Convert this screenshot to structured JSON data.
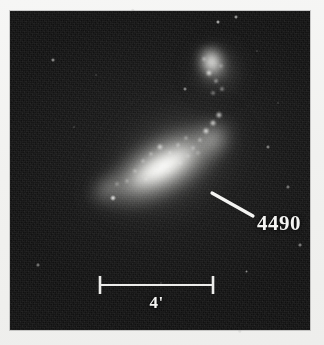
{
  "figure": {
    "kind": "astronomical-photograph",
    "media": "scanned printed plate",
    "paper_color": "#f2f2f0",
    "plate_background_color": "#101010",
    "annotation_color": "#f4f4f2"
  },
  "annotations": {
    "object_label": "4490",
    "object_label_leader_line": {
      "x1": 202,
      "y1": 182,
      "x2": 243,
      "y2": 205
    },
    "scale_bar": {
      "label": "4'",
      "unit": "arcminutes",
      "value": 4,
      "left_tick_x": 90,
      "right_tick_x": 203,
      "bar_y": 274,
      "tick_half_height": 9
    }
  },
  "objects": [
    {
      "name": "NGC 4490",
      "designation_shown": "4490",
      "type": "barred irregular / interacting spiral galaxy",
      "position_on_plate": {
        "x": 155,
        "y": 160
      },
      "major_axis_px": 215,
      "minor_axis_px": 90,
      "position_angle_deg": -30,
      "labelled": true
    },
    {
      "name": "NGC 4485",
      "designation_shown": "",
      "type": "irregular companion galaxy",
      "position_on_plate": {
        "x": 205,
        "y": 58
      },
      "major_axis_px": 46,
      "minor_axis_px": 38,
      "position_angle_deg": -14,
      "labelled": false
    }
  ],
  "knots": [
    {
      "x": 196,
      "y": 120,
      "r": 3.4,
      "o": 0.95
    },
    {
      "x": 203,
      "y": 112,
      "r": 2.8,
      "o": 0.9
    },
    {
      "x": 190,
      "y": 129,
      "r": 2.4,
      "o": 0.82
    },
    {
      "x": 209,
      "y": 104,
      "r": 2.6,
      "o": 0.88
    },
    {
      "x": 183,
      "y": 137,
      "r": 2.2,
      "o": 0.74
    },
    {
      "x": 176,
      "y": 127,
      "r": 2.0,
      "o": 0.7
    },
    {
      "x": 168,
      "y": 134,
      "r": 2.4,
      "o": 0.78
    },
    {
      "x": 160,
      "y": 142,
      "r": 2.1,
      "o": 0.7
    },
    {
      "x": 150,
      "y": 136,
      "r": 2.6,
      "o": 0.84
    },
    {
      "x": 141,
      "y": 143,
      "r": 2.2,
      "o": 0.76
    },
    {
      "x": 133,
      "y": 150,
      "r": 2.0,
      "o": 0.68
    },
    {
      "x": 147,
      "y": 155,
      "r": 2.3,
      "o": 0.74
    },
    {
      "x": 158,
      "y": 160,
      "r": 2.1,
      "o": 0.7
    },
    {
      "x": 170,
      "y": 152,
      "r": 2.0,
      "o": 0.66
    },
    {
      "x": 125,
      "y": 160,
      "r": 2.2,
      "o": 0.7
    },
    {
      "x": 117,
      "y": 170,
      "r": 2.0,
      "o": 0.62
    },
    {
      "x": 136,
      "y": 168,
      "r": 1.9,
      "o": 0.6
    },
    {
      "x": 178,
      "y": 145,
      "r": 1.8,
      "o": 0.58
    },
    {
      "x": 188,
      "y": 142,
      "r": 1.7,
      "o": 0.54
    },
    {
      "x": 107,
      "y": 173,
      "r": 1.9,
      "o": 0.58
    },
    {
      "x": 199,
      "y": 62,
      "r": 2.6,
      "o": 0.92
    },
    {
      "x": 206,
      "y": 70,
      "r": 2.4,
      "o": 0.86
    },
    {
      "x": 212,
      "y": 78,
      "r": 2.2,
      "o": 0.82
    },
    {
      "x": 203,
      "y": 82,
      "r": 2.0,
      "o": 0.74
    },
    {
      "x": 194,
      "y": 48,
      "r": 2.3,
      "o": 0.8
    },
    {
      "x": 211,
      "y": 55,
      "r": 1.8,
      "o": 0.62
    }
  ],
  "field_stars": [
    {
      "x": 208,
      "y": 11,
      "r": 2.4,
      "o": 0.9
    },
    {
      "x": 226,
      "y": 6,
      "r": 2.0,
      "o": 0.8
    },
    {
      "x": 43,
      "y": 49,
      "r": 1.8,
      "o": 0.7
    },
    {
      "x": 175,
      "y": 78,
      "r": 1.7,
      "o": 0.64
    },
    {
      "x": 258,
      "y": 136,
      "r": 1.7,
      "o": 0.62
    },
    {
      "x": 103,
      "y": 187,
      "r": 2.6,
      "o": 0.92
    },
    {
      "x": 278,
      "y": 176,
      "r": 1.6,
      "o": 0.58
    },
    {
      "x": 290,
      "y": 234,
      "r": 1.7,
      "o": 0.62
    },
    {
      "x": 236,
      "y": 260,
      "r": 1.5,
      "o": 0.52
    },
    {
      "x": 28,
      "y": 254,
      "r": 1.6,
      "o": 0.56
    },
    {
      "x": 151,
      "y": 272,
      "r": 1.4,
      "o": 0.46
    },
    {
      "x": 64,
      "y": 116,
      "r": 1.4,
      "o": 0.44
    },
    {
      "x": 247,
      "y": 40,
      "r": 1.4,
      "o": 0.44
    },
    {
      "x": 86,
      "y": 64,
      "r": 1.3,
      "o": 0.4
    },
    {
      "x": 268,
      "y": 92,
      "r": 1.3,
      "o": 0.4
    }
  ]
}
